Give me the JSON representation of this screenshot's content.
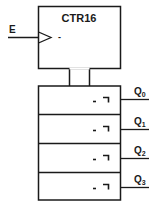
{
  "diagram": {
    "type": "logic-symbol",
    "title": "CTR16",
    "control_block": {
      "label": "CTR16",
      "input": {
        "name": "E",
        "type": "clock",
        "symbol": "dynamic-indicator",
        "polarity_mark": "-"
      }
    },
    "outputs": [
      {
        "name": "Q",
        "subscript": "0",
        "mark": "- ¬"
      },
      {
        "name": "Q",
        "subscript": "1",
        "mark": "- ¬"
      },
      {
        "name": "Q",
        "subscript": "2",
        "mark": "- ¬"
      },
      {
        "name": "Q",
        "subscript": "3",
        "mark": "- ¬"
      }
    ],
    "colors": {
      "stroke": "#1a1a1a",
      "background": "#ffffff"
    }
  }
}
